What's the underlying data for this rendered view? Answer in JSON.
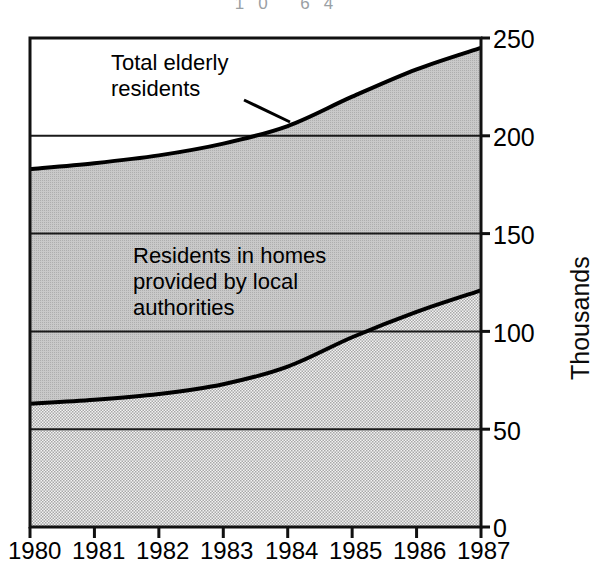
{
  "scan": {
    "header_fragment": "10  64"
  },
  "chart_data": {
    "type": "area",
    "title": "",
    "subtitle": "",
    "xlabel": "",
    "ylabel": "Thousands",
    "ylim": [
      0,
      250
    ],
    "yticks": [
      0,
      50,
      100,
      150,
      200,
      250
    ],
    "xlim": [
      1980,
      1987
    ],
    "x": [
      1980,
      1981,
      1982,
      1983,
      1984,
      1985,
      1986,
      1987
    ],
    "categories": [
      "1980",
      "1981",
      "1982",
      "1983",
      "1984",
      "1985",
      "1986",
      "1987"
    ],
    "grid": true,
    "grid_orientation": "horizontal",
    "legend": "inline-annotations",
    "stacked": false,
    "series": [
      {
        "name": "Total elderly residents",
        "values": [
          183,
          186,
          190,
          196,
          205,
          220,
          234,
          245
        ],
        "fill": "#b3b3b3",
        "line_color": "#000000",
        "annotation": "Total elderly\nresidents"
      },
      {
        "name": "Residents in homes provided by local authorities",
        "values": [
          63,
          65,
          68,
          73,
          82,
          97,
          110,
          121
        ],
        "fill": "#dcdcdc",
        "line_color": "#000000",
        "annotation": "Residents in homes\nprovided by local\nauthorities"
      }
    ],
    "annotations": [
      {
        "id": "total-elderly-annotation",
        "text_line1": "Total elderly",
        "text_line2": "residents",
        "leader_line": true
      },
      {
        "id": "local-authority-annotation",
        "text_line1": "Residents in homes",
        "text_line2": "provided by local",
        "text_line3": "authorities",
        "leader_line": false
      }
    ]
  },
  "axes": {
    "y_tick_labels": [
      "250",
      "200",
      "150",
      "100",
      "50",
      "0"
    ],
    "y_axis_title": "Thousands",
    "x_tick_labels": [
      "1980",
      "1981",
      "1982",
      "1983",
      "1984",
      "1985",
      "1986",
      "1987"
    ]
  },
  "colors": {
    "upper_band_fill": "#b3b3b3",
    "lower_band_fill": "#dcdcdc",
    "curve": "#000000",
    "frame": "#111111",
    "gridline": "#1a1a1a",
    "background": "#ffffff"
  }
}
